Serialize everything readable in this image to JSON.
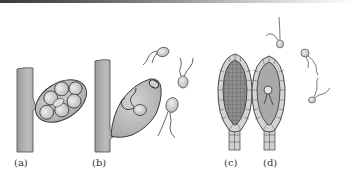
{
  "figure": {
    "panels": [
      {
        "id": "a",
        "label": "(a)",
        "label_x": 14,
        "label_y": 157,
        "description": "sporangium with spores attached to stalk"
      },
      {
        "id": "b",
        "label": "(b)",
        "label_x": 92,
        "label_y": 157,
        "description": "sporangium releasing flagellated zoospores"
      },
      {
        "id": "c",
        "label": "(c)",
        "label_x": 224,
        "label_y": 157,
        "description": "antheridium with sperm cells"
      },
      {
        "id": "d",
        "label": "(d)",
        "label_x": 263,
        "label_y": 157,
        "description": "archegonium with egg and swimming sperm"
      }
    ],
    "colors": {
      "stalk": "#b4b4b4",
      "stalk_outline": "#555555",
      "sporangium_fill": "#c6c6c6",
      "spore_fill": "#d9d9d9",
      "cell_fill": "#d0d0d0",
      "inner_dark": "#8c8c8c",
      "inner_mid": "#b0b0b0",
      "line": "#333333"
    }
  }
}
